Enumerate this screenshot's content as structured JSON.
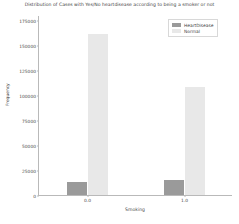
{
  "chart_data": {
    "type": "bar",
    "title": "Distribution of Cases with Yes/No heartdisease according to being a smoker or not",
    "xlabel": "Smoking",
    "ylabel": "Frequency",
    "categories": [
      "0.0",
      "1.0"
    ],
    "series": [
      {
        "name": "HeartDisease",
        "color": "#9a9a9a",
        "values": [
          13000,
          15500
        ]
      },
      {
        "name": "Normal",
        "color": "#e8e8e8",
        "values": [
          161000,
          108000
        ]
      }
    ],
    "ylim": [
      0,
      180000
    ],
    "yticks": [
      0,
      25000,
      50000,
      75000,
      100000,
      125000,
      150000,
      175000
    ],
    "ytick_labels": [
      "0",
      "25000",
      "50000",
      "75000",
      "100000",
      "125000",
      "150000",
      "175000"
    ],
    "grid": false,
    "legend_position": "upper right"
  },
  "legend": {
    "entries": [
      {
        "label": "HeartDisease"
      },
      {
        "label": "Normal"
      }
    ]
  }
}
